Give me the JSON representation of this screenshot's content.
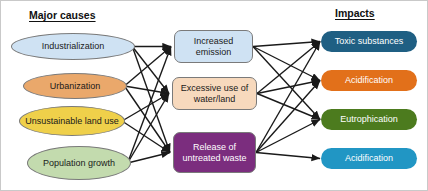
{
  "diagram": {
    "headers": {
      "left": "Major causes",
      "right": "Impacts"
    },
    "columns": {
      "causes": [
        {
          "id": "industrialization",
          "label": "Industrialization",
          "shape": "ellipse",
          "fill": "#cfe2f3",
          "text_color": "#1a1a1a",
          "x": 10,
          "y": 32,
          "w": 124,
          "h": 27
        },
        {
          "id": "urbanization",
          "label": "Urbanization",
          "shape": "ellipse",
          "fill": "#eaa86b",
          "text_color": "#1a1a1a",
          "x": 22,
          "y": 72,
          "w": 104,
          "h": 26
        },
        {
          "id": "unsustainable-land-use",
          "label": "Unsustainable land use",
          "shape": "ellipse",
          "fill": "#efd04a",
          "text_color": "#1a1a1a",
          "x": 18,
          "y": 105,
          "w": 106,
          "h": 30
        },
        {
          "id": "population-growth",
          "label": "Population growth",
          "shape": "ellipse",
          "fill": "#c3dbae",
          "text_color": "#1a1a1a",
          "x": 26,
          "y": 145,
          "w": 104,
          "h": 34
        }
      ],
      "intermediates": [
        {
          "id": "increased-emission",
          "label": "Increased emission",
          "shape": "rounded-box",
          "fill": "#cfe2f3",
          "text_color": "#1a1a1a",
          "x": 173,
          "y": 29,
          "w": 79,
          "h": 33
        },
        {
          "id": "excessive-use-water-land",
          "label": "Excessive use of water/land",
          "shape": "rounded-box",
          "fill": "#f7d9bd",
          "text_color": "#1a1a1a",
          "x": 171,
          "y": 76,
          "w": 85,
          "h": 33
        },
        {
          "id": "release-untreated-waste",
          "label": "Release of untreated waste",
          "shape": "rounded-box",
          "fill": "#7b2d7e",
          "text_color": "#ffffff",
          "x": 172,
          "y": 131,
          "w": 83,
          "h": 41
        }
      ],
      "impacts": [
        {
          "id": "toxic-substances",
          "label": "Toxic substances",
          "shape": "pill",
          "fill": "#1f5f83",
          "text_color": "#ffffff",
          "x": 320,
          "y": 30,
          "w": 96,
          "h": 21
        },
        {
          "id": "acidification-orange",
          "label": "Acidification",
          "shape": "pill",
          "fill": "#e2701a",
          "text_color": "#ffffff",
          "x": 320,
          "y": 69,
          "w": 96,
          "h": 21
        },
        {
          "id": "eutrophication",
          "label": "Eutrophication",
          "shape": "pill",
          "fill": "#4c7b1e",
          "text_color": "#ffffff",
          "x": 320,
          "y": 108,
          "w": 96,
          "h": 21
        },
        {
          "id": "acidification-blue",
          "label": "Acidification",
          "shape": "pill",
          "fill": "#2196c4",
          "text_color": "#ffffff",
          "x": 320,
          "y": 147,
          "w": 96,
          "h": 21
        }
      ]
    },
    "edges": {
      "stroke": "#1a1a1a",
      "stroke_width": 1.4,
      "links": [
        {
          "from": "industrialization",
          "to": "increased-emission"
        },
        {
          "from": "industrialization",
          "to": "excessive-use-water-land"
        },
        {
          "from": "industrialization",
          "to": "release-untreated-waste"
        },
        {
          "from": "urbanization",
          "to": "increased-emission"
        },
        {
          "from": "urbanization",
          "to": "excessive-use-water-land"
        },
        {
          "from": "urbanization",
          "to": "release-untreated-waste"
        },
        {
          "from": "unsustainable-land-use",
          "to": "excessive-use-water-land"
        },
        {
          "from": "unsustainable-land-use",
          "to": "release-untreated-waste"
        },
        {
          "from": "population-growth",
          "to": "increased-emission"
        },
        {
          "from": "population-growth",
          "to": "excessive-use-water-land"
        },
        {
          "from": "population-growth",
          "to": "release-untreated-waste"
        },
        {
          "from": "increased-emission",
          "to": "toxic-substances"
        },
        {
          "from": "increased-emission",
          "to": "acidification-orange"
        },
        {
          "from": "increased-emission",
          "to": "eutrophication"
        },
        {
          "from": "excessive-use-water-land",
          "to": "toxic-substances"
        },
        {
          "from": "excessive-use-water-land",
          "to": "acidification-orange"
        },
        {
          "from": "excessive-use-water-land",
          "to": "eutrophication"
        },
        {
          "from": "release-untreated-waste",
          "to": "toxic-substances"
        },
        {
          "from": "release-untreated-waste",
          "to": "acidification-orange"
        },
        {
          "from": "release-untreated-waste",
          "to": "eutrophication"
        },
        {
          "from": "release-untreated-waste",
          "to": "acidification-blue"
        }
      ]
    }
  }
}
